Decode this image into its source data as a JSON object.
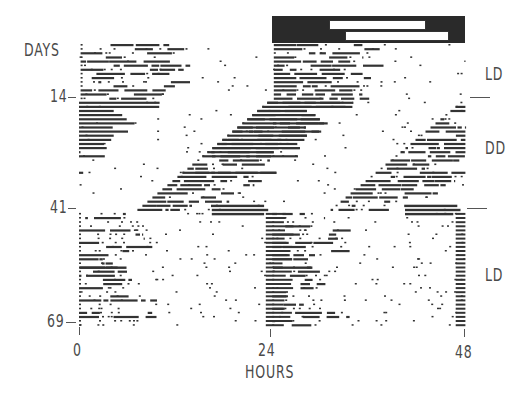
{
  "chart_data": {
    "type": "heatmap",
    "subtype": "double-plotted actogram",
    "title": "",
    "xlabel": "HOURS",
    "ylabel": "DAYS",
    "x_ticks": [
      0,
      24,
      48
    ],
    "y_ticks": [
      14,
      41,
      69
    ],
    "xlim": [
      0,
      48
    ],
    "ylim": [
      1,
      69
    ],
    "conditions": [
      {
        "label": "LD",
        "days": [
          1,
          14
        ]
      },
      {
        "label": "DD",
        "days": [
          14,
          41
        ]
      },
      {
        "label": "LD",
        "days": [
          41,
          69
        ]
      }
    ],
    "light_dark_bar": {
      "hours": [
        24,
        48
      ],
      "light_phase_top": [
        30,
        43
      ],
      "light_phase_bottom": [
        31.5,
        45
      ],
      "dark_color": "#2a2a2a",
      "light_color": "#ffffff"
    },
    "activity_description": "Activity onset entrained during first LD segment (days 1-14), free-runs with period < 24 h in DD (days 14-41, phase advancing leftward ~0.6 h/day), and re-entrains during final LD (days 41-69)."
  },
  "axes": {
    "ylabel": "DAYS",
    "xlabel": "HOURS",
    "y_ticks": [
      "14",
      "41",
      "69"
    ],
    "x_ticks": [
      "0",
      "24",
      "48"
    ]
  },
  "conditions": {
    "top": "LD",
    "middle": "DD",
    "bottom": "LD"
  },
  "colors": {
    "ink": "#333333",
    "text": "#4a4a4a",
    "background": "#ffffff"
  }
}
